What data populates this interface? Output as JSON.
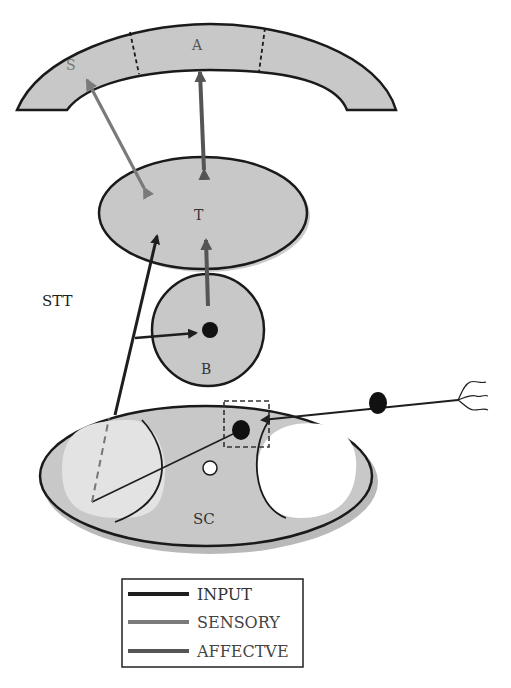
{
  "diagram": {
    "nodes": {
      "cortex": {
        "regions": [
          "S",
          "A"
        ]
      },
      "thalamus": {
        "label": "T"
      },
      "brainstem": {
        "label": "B"
      },
      "spinal_cord": {
        "label": "SC"
      }
    },
    "tract_label": "STT",
    "edges": [
      {
        "from": "SC",
        "to": "T",
        "type": "INPUT",
        "label": "STT"
      },
      {
        "from": "SC",
        "to": "B",
        "type": "INPUT"
      },
      {
        "from": "periphery",
        "to": "SC",
        "type": "INPUT"
      },
      {
        "from": "B",
        "to": "T",
        "type": "AFFECTIVE"
      },
      {
        "from": "T",
        "to": "S",
        "type": "SENSORY",
        "bidirectional": true
      },
      {
        "from": "T",
        "to": "A",
        "type": "AFFECTIVE",
        "bidirectional": true
      }
    ]
  },
  "legend": {
    "items": [
      {
        "label": "INPUT",
        "color": "#1e1e1e"
      },
      {
        "label": "SENSORY",
        "color": "#7a7a7a"
      },
      {
        "label": "AFFECTIVE",
        "display": "AFFECTVE",
        "color": "#555555"
      }
    ]
  },
  "colors": {
    "fill": "#c8c8c8",
    "stroke": "#1a1a1a",
    "sensory": "#7a7a7a",
    "affective": "#555555",
    "input": "#1e1e1e"
  }
}
